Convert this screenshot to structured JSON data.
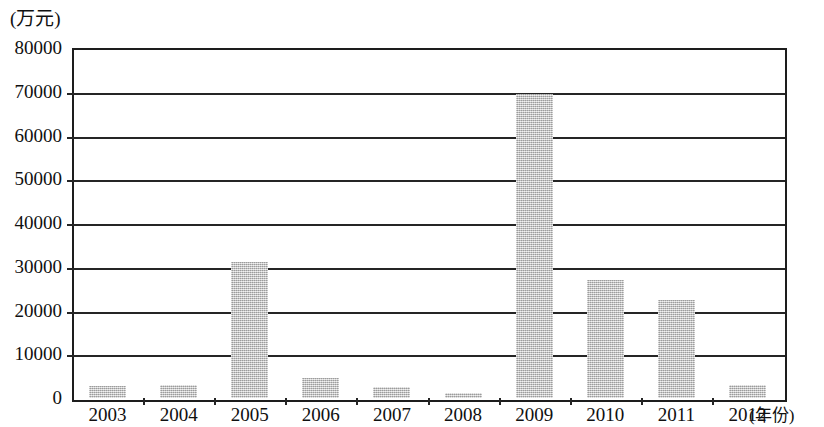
{
  "chart_data": {
    "type": "bar",
    "title": "",
    "subtitle": "",
    "xlabel": "(年份)",
    "ylabel": "(万元)",
    "categories": [
      "2003",
      "2004",
      "2005",
      "2006",
      "2007",
      "2008",
      "2009",
      "2010",
      "2011",
      "2012"
    ],
    "values": [
      2800,
      3000,
      31000,
      4500,
      2600,
      1200,
      69500,
      27000,
      22500,
      2900
    ],
    "series": [
      {
        "name": "",
        "values": [
          2800,
          3000,
          31000,
          4500,
          2600,
          1200,
          69500,
          27000,
          22500,
          2900
        ]
      }
    ],
    "ylim": [
      0,
      80000
    ],
    "ytick_labels": [
      "0",
      "10000",
      "20000",
      "30000",
      "40000",
      "50000",
      "60000",
      "70000",
      "80000"
    ],
    "ytick_values": [
      0,
      10000,
      20000,
      30000,
      40000,
      50000,
      60000,
      70000,
      80000
    ],
    "grid": true,
    "grid_axis": "y",
    "legend": false,
    "legend_position": "none",
    "bar_color": "#c0c0c0",
    "axis_color": "#252525",
    "text_color": "#101010"
  },
  "axes": {
    "y_unit_caption": "(万元)",
    "x_unit_caption": "(年份)"
  }
}
